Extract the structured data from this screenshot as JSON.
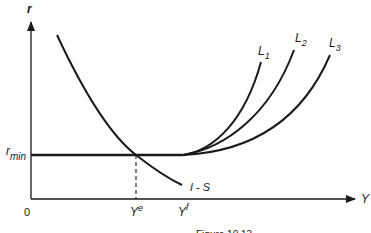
{
  "diagram": {
    "type": "economics-curve-diagram",
    "axes": {
      "y_label": "r",
      "x_label": "Y",
      "origin_label": "0"
    },
    "levels": {
      "r_min": {
        "base": "r",
        "subscript": "min"
      }
    },
    "x_marks": {
      "y_e": {
        "base": "Y",
        "superscript": "e"
      },
      "y_f": {
        "base": "Y",
        "superscript": "f"
      }
    },
    "curves": [
      {
        "id": "is",
        "label": "I - S"
      },
      {
        "id": "l1",
        "label": {
          "base": "L",
          "subscript": "1"
        }
      },
      {
        "id": "l2",
        "label": {
          "base": "L",
          "subscript": "2"
        }
      },
      {
        "id": "l3",
        "label": {
          "base": "L",
          "subscript": "3"
        }
      }
    ],
    "caption": "Figure 10.13"
  },
  "colors": {
    "ink": "#1a1a1a",
    "background": "#ffffff"
  }
}
